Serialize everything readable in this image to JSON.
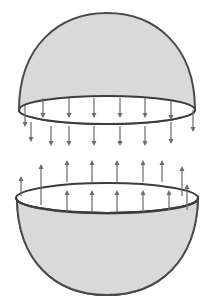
{
  "figure": {
    "colors": {
      "shell_fill": "#d9d9d9",
      "outline": "#3c3c3c",
      "arrow": "#6a6a6a",
      "background": "#ffffff"
    },
    "top_hemisphere": {
      "label": "upper-hemisphere",
      "rim": {
        "cx": 107,
        "cy": 110,
        "rx": 88,
        "ry": 14
      },
      "arrows_direction": "down",
      "arrows": [
        {
          "x": 25,
          "y1": 106,
          "y2": 127
        },
        {
          "x": 43,
          "y1": 98,
          "y2": 118
        },
        {
          "x": 69,
          "y1": 98,
          "y2": 118
        },
        {
          "x": 94,
          "y1": 98,
          "y2": 118
        },
        {
          "x": 120,
          "y1": 98,
          "y2": 118
        },
        {
          "x": 145,
          "y1": 98,
          "y2": 118
        },
        {
          "x": 171,
          "y1": 100,
          "y2": 120
        },
        {
          "x": 193,
          "y1": 110,
          "y2": 132
        },
        {
          "x": 31,
          "y1": 122,
          "y2": 142
        },
        {
          "x": 51,
          "y1": 126,
          "y2": 146
        },
        {
          "x": 69,
          "y1": 126,
          "y2": 146
        },
        {
          "x": 94,
          "y1": 126,
          "y2": 146
        },
        {
          "x": 120,
          "y1": 126,
          "y2": 146
        },
        {
          "x": 145,
          "y1": 126,
          "y2": 146
        },
        {
          "x": 171,
          "y1": 122,
          "y2": 144
        }
      ]
    },
    "bottom_hemisphere": {
      "label": "lower-hemisphere",
      "rim": {
        "cx": 107,
        "cy": 198,
        "rx": 91,
        "ry": 15
      },
      "arrows_direction": "up",
      "arrows": [
        {
          "x": 21,
          "y1": 196,
          "y2": 176
        },
        {
          "x": 41,
          "y1": 205,
          "y2": 164
        },
        {
          "x": 67,
          "y1": 182,
          "y2": 160
        },
        {
          "x": 92,
          "y1": 182,
          "y2": 160
        },
        {
          "x": 117,
          "y1": 182,
          "y2": 160
        },
        {
          "x": 143,
          "y1": 182,
          "y2": 160
        },
        {
          "x": 162,
          "y1": 182,
          "y2": 160
        },
        {
          "x": 182,
          "y1": 196,
          "y2": 166
        },
        {
          "x": 187,
          "y1": 210,
          "y2": 184
        },
        {
          "x": 67,
          "y1": 212,
          "y2": 190
        },
        {
          "x": 92,
          "y1": 212,
          "y2": 190
        },
        {
          "x": 117,
          "y1": 212,
          "y2": 190
        },
        {
          "x": 143,
          "y1": 212,
          "y2": 190
        },
        {
          "x": 169,
          "y1": 210,
          "y2": 190
        }
      ]
    }
  }
}
